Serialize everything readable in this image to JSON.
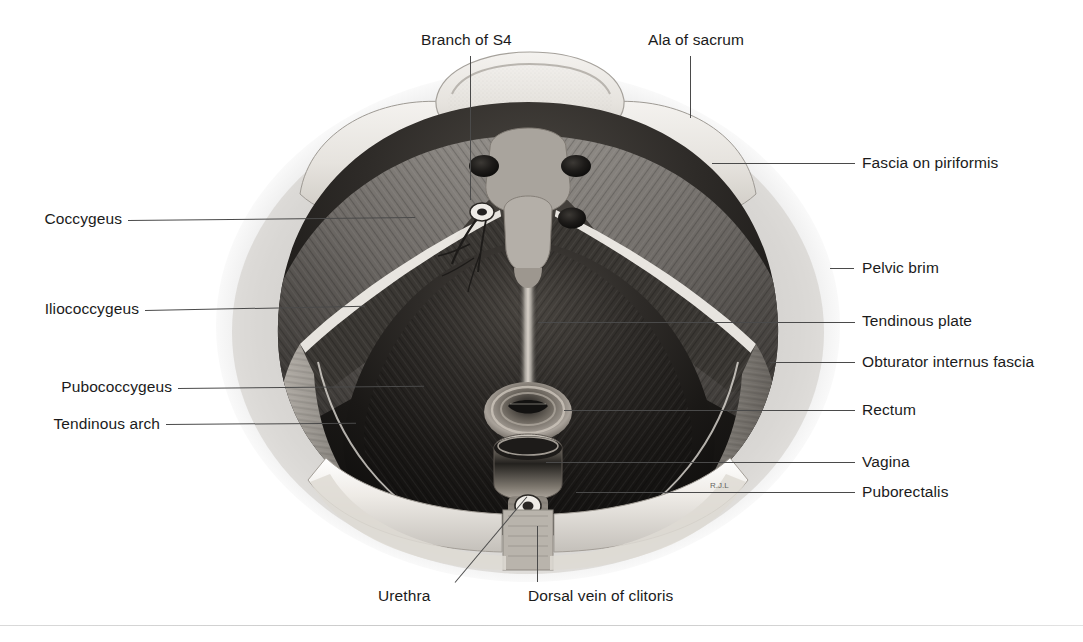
{
  "figure": {
    "kind": "anatomical-illustration",
    "background_color": "#ffffff",
    "ink_color": "#1b1b1b",
    "leader_color": "#4a4a4a"
  },
  "labels": {
    "branch_of_s4": "Branch of S4",
    "ala_of_sacrum": "Ala of sacrum",
    "fascia_on_piriformis": "Fascia on piriformis",
    "coccygeus": "Coccygeus",
    "pelvic_brim": "Pelvic brim",
    "iliococcygeus": "Iliococcygeus",
    "tendinous_plate": "Tendinous plate",
    "obturator_internus_fascia": "Obturator internus fascia",
    "pubococcygeus": "Pubococcygeus",
    "rectum": "Rectum",
    "tendinous_arch": "Tendinous arch",
    "vagina": "Vagina",
    "puborectalis": "Puborectalis",
    "urethra": "Urethra",
    "dorsal_vein_of_clitoris": "Dorsal vein of clitoris"
  },
  "structures": {
    "sacral_foramina_count": 3,
    "midline_raphe": "tendinous plate",
    "visceral_openings": [
      "rectum",
      "vagina",
      "urethra"
    ]
  }
}
